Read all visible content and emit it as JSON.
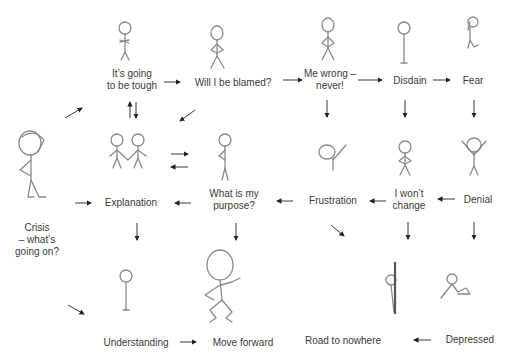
{
  "diagram": {
    "type": "emotional-journey-flow",
    "nodes": [
      {
        "id": "crisis",
        "label": "Crisis\n– what’s\ngoing on?",
        "x": 37,
        "y": 240
      },
      {
        "id": "tough",
        "label": "It’s going\nto be tough",
        "x": 132,
        "y": 80
      },
      {
        "id": "blamed",
        "label": "Will I be blamed?",
        "x": 247,
        "y": 83
      },
      {
        "id": "wrong",
        "label": "Me wrong –\nnever!",
        "x": 330,
        "y": 80
      },
      {
        "id": "disdain",
        "label": "Disdain",
        "x": 403,
        "y": 82
      },
      {
        "id": "fear",
        "label": "Fear",
        "x": 472,
        "y": 82
      },
      {
        "id": "explanation",
        "label": "Explanation",
        "x": 131,
        "y": 203
      },
      {
        "id": "purpose",
        "label": "What is my\npurpose?",
        "x": 234,
        "y": 200
      },
      {
        "id": "frustration",
        "label": "Frustration",
        "x": 333,
        "y": 201
      },
      {
        "id": "wontchange",
        "label": "I won’t\nchange",
        "x": 409,
        "y": 200
      },
      {
        "id": "denial",
        "label": "Denial",
        "x": 478,
        "y": 200
      },
      {
        "id": "understanding",
        "label": "Understanding",
        "x": 136,
        "y": 343
      },
      {
        "id": "moveforward",
        "label": "Move forward",
        "x": 243,
        "y": 343
      },
      {
        "id": "nowhere",
        "label": "Road to nowhere",
        "x": 343,
        "y": 341
      },
      {
        "id": "depressed",
        "label": "Depressed",
        "x": 470,
        "y": 340
      }
    ],
    "edges": [
      [
        "crisis",
        "tough"
      ],
      [
        "tough",
        "blamed"
      ],
      [
        "blamed",
        "wrong"
      ],
      [
        "wrong",
        "disdain"
      ],
      [
        "disdain",
        "fear"
      ],
      [
        "tough",
        "pair"
      ],
      [
        "pair",
        "tough"
      ],
      [
        "blamed",
        "pair"
      ],
      [
        "pair",
        "confused"
      ],
      [
        "confused",
        "pair"
      ],
      [
        "wrong",
        "frustration-fig"
      ],
      [
        "disdain",
        "wontchange-fig"
      ],
      [
        "fear",
        "denial-fig"
      ],
      [
        "crisis",
        "explanation"
      ],
      [
        "purpose",
        "explanation"
      ],
      [
        "frustration",
        "purpose"
      ],
      [
        "wontchange",
        "frustration"
      ],
      [
        "denial",
        "wontchange"
      ],
      [
        "explanation",
        "understanding-fig"
      ],
      [
        "purpose",
        "moveforward-fig"
      ],
      [
        "frustration",
        "nowhere-fig"
      ],
      [
        "wontchange",
        "nowhere-fig"
      ],
      [
        "denial",
        "depressed-fig"
      ],
      [
        "crisis",
        "understanding"
      ],
      [
        "understanding",
        "moveforward"
      ],
      [
        "depressed",
        "nowhere"
      ]
    ],
    "colors": {
      "figure_stroke": "#8a8a8a",
      "text": "#3a3a3a",
      "arrow": "#222222",
      "background": "#ffffff"
    }
  }
}
